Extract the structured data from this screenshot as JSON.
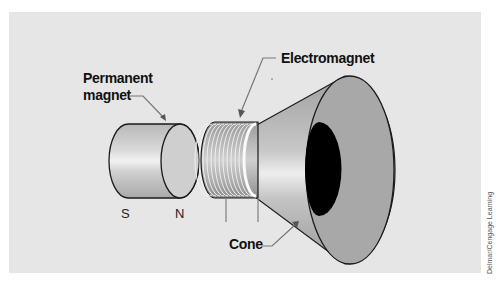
{
  "diagram": {
    "labels": {
      "permanent_magnet_line1": "Permanent",
      "permanent_magnet_line2": "magnet",
      "electromagnet": "Electromagnet",
      "cone": "Cone",
      "south_pole": "S",
      "north_pole": "N"
    },
    "credit": "Delmar/Cengage Learning",
    "colors": {
      "panel_bg": "#e6e6e6",
      "page_bg": "#ffffff",
      "outline": "#1a1a1a",
      "cone_face": "#a8a8a8",
      "cone_throat": "#000000",
      "leader_line": "#777777"
    },
    "components": [
      {
        "name": "Permanent magnet",
        "shape": "cylinder",
        "poles": [
          "S",
          "N"
        ]
      },
      {
        "name": "Electromagnet",
        "shape": "wire coil around cylinder"
      },
      {
        "name": "Cone",
        "shape": "truncated cone with open mouth"
      }
    ]
  }
}
